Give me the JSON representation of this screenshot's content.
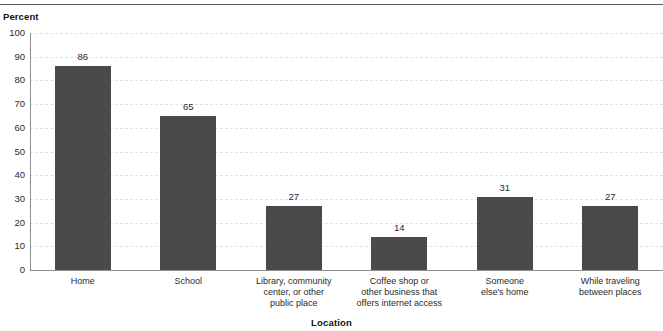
{
  "chart_data": {
    "type": "bar",
    "title": "",
    "xlabel": "Location",
    "ylabel": "Percent",
    "ylim": [
      0,
      100
    ],
    "ytick_step": 10,
    "yticks": [
      "100",
      "90",
      "80",
      "70",
      "60",
      "50",
      "40",
      "30",
      "20",
      "10",
      "0"
    ],
    "grid": true,
    "legend": "none",
    "bar_color": "#4a4a4a",
    "categories": [
      "Home",
      "School",
      "Library, community center, or other public place",
      "Coffee shop or other business that offers internet access",
      "Someone else's home",
      "While traveling between places"
    ],
    "category_lines": [
      [
        "Home"
      ],
      [
        "School"
      ],
      [
        "Library, community",
        "center, or other",
        "public place"
      ],
      [
        "Coffee shop or",
        "other business that",
        "offers internet access"
      ],
      [
        "Someone",
        "else's home"
      ],
      [
        "While traveling",
        "between places"
      ]
    ],
    "values": [
      86,
      65,
      27,
      14,
      31,
      27
    ],
    "value_labels": [
      "86",
      "65",
      "27",
      "14",
      "31",
      "27"
    ]
  }
}
